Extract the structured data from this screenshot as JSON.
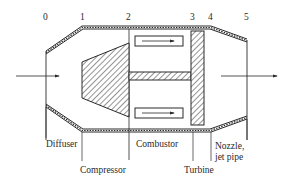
{
  "diagram": {
    "type": "turbojet-engine-schematic",
    "stations": [
      {
        "id": "0",
        "label": "0",
        "x": 46
      },
      {
        "id": "1",
        "label": "1",
        "x": 82
      },
      {
        "id": "2",
        "label": "2",
        "x": 129
      },
      {
        "id": "3",
        "label": "3",
        "x": 193
      },
      {
        "id": "4",
        "label": "4",
        "x": 211
      },
      {
        "id": "5",
        "label": "5",
        "x": 247
      }
    ],
    "components": [
      {
        "id": "diffuser",
        "label": "Diffuser"
      },
      {
        "id": "compressor",
        "label": "Compressor"
      },
      {
        "id": "combustor",
        "label": "Combustor"
      },
      {
        "id": "turbine",
        "label": "Turbine"
      },
      {
        "id": "nozzle",
        "label_line1": "Nozzle,",
        "label_line2": "jet pipe"
      }
    ],
    "flow": {
      "inlet_arrow": "inflow",
      "outlet_arrow": "outflow"
    },
    "colors": {
      "line": "#2a2a2a",
      "background": "#ffffff"
    }
  }
}
